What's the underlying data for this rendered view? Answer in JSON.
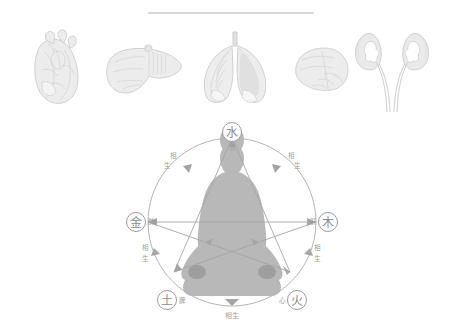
{
  "page": {
    "divider": "horizontal-rule"
  },
  "organs": [
    {
      "id": "heart",
      "icon": "heart-organ-icon",
      "label": "心"
    },
    {
      "id": "liver",
      "icon": "liver-organ-icon",
      "label": "肝"
    },
    {
      "id": "lungs",
      "icon": "lungs-organ-icon",
      "label": "肺"
    },
    {
      "id": "spleen",
      "icon": "spleen-organ-icon",
      "label": "脾"
    },
    {
      "id": "kidneys",
      "icon": "kidneys-organ-icon",
      "label": "肾"
    }
  ],
  "wuxing": {
    "center_figure": "meditating-figure-silhouette",
    "nodes": [
      {
        "id": "water",
        "element": "水",
        "organ": "肾",
        "position": "top"
      },
      {
        "id": "wood",
        "element": "木",
        "organ": "肝",
        "position": "right"
      },
      {
        "id": "fire",
        "element": "火",
        "organ": "心",
        "position": "bottom-right"
      },
      {
        "id": "earth",
        "element": "土",
        "organ": "脾",
        "position": "bottom-left"
      },
      {
        "id": "metal",
        "element": "金",
        "organ": "肺",
        "position": "left"
      }
    ],
    "arc_labels": [
      {
        "id": "arc-metal-water",
        "line1": "相",
        "line2": "生"
      },
      {
        "id": "arc-water-wood",
        "line1": "相",
        "line2": "生"
      },
      {
        "id": "arc-wood-fire",
        "line1": "相",
        "line2": "生"
      },
      {
        "id": "arc-earth-metal",
        "line1": "相",
        "line2": "生"
      },
      {
        "id": "arc-fire-earth",
        "text": "相生"
      }
    ]
  },
  "colors": {
    "ink": "#9a9a9a",
    "ink_light": "#c4c4c4",
    "organ_fill": "#e9e9e9",
    "organ_stroke": "#cfcfcf",
    "figure_fill": "#9d9d9d",
    "rule": "#d8d8d8"
  }
}
